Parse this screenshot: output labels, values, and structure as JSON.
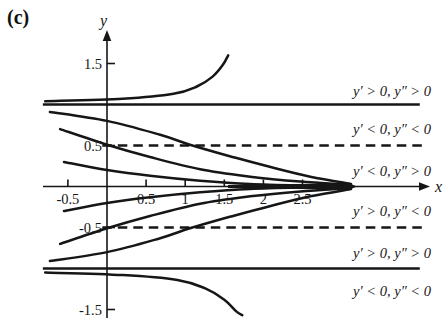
{
  "figure_label": "(c)",
  "colors": {
    "ink": "#161616",
    "background": "#ffffff"
  },
  "chart_data": {
    "type": "line",
    "title": "(c)",
    "xlabel": "x",
    "ylabel": "y",
    "x_ticks": [
      -0.5,
      0.5,
      1,
      1.5,
      2,
      2.5
    ],
    "x_tick_labels": [
      "-0.5",
      "0.5",
      "1",
      "1.5",
      "2",
      "2.5"
    ],
    "y_ticks": [
      1.5,
      0.5,
      -0.5,
      -1.5
    ],
    "y_tick_labels": [
      "1.5",
      "0.5",
      "-0.5",
      "-1.5"
    ],
    "xlim": [
      -0.82,
      4.35
    ],
    "ylim": [
      -1.85,
      1.87
    ],
    "grid": false,
    "equilibrium_lines": {
      "style": "solid",
      "values": [
        1,
        -1
      ],
      "x_range": [
        -0.82,
        4.0
      ]
    },
    "inflection_lines": {
      "style": "dashed",
      "values": [
        0.5,
        -0.5
      ],
      "x_range": [
        -0.06,
        4.03
      ]
    },
    "region_labels": [
      {
        "text": "y′ > 0, y″ > 0",
        "band": "y > 1",
        "y": 1.16
      },
      {
        "text": "y′ < 0, y″ < 0",
        "band": "0.5 < y < 1",
        "y": 0.7
      },
      {
        "text": "y′ < 0, y″ > 0",
        "band": "0 < y < 0.5",
        "y": 0.19
      },
      {
        "text": "y′ > 0, y″ < 0",
        "band": "-0.5 < y < 0",
        "y": -0.3
      },
      {
        "text": "y′ > 0, y″ > 0",
        "band": "-1 < y < -0.5",
        "y": -0.81
      },
      {
        "text": "y′ < 0, y″ < 0",
        "band": "y < -1",
        "y": -1.28
      }
    ],
    "series": [
      {
        "name": "solution-diverging-above-y1",
        "points": [
          [
            -0.79,
            1.04
          ],
          [
            0.2,
            1.07
          ],
          [
            0.85,
            1.13
          ],
          [
            1.15,
            1.22
          ],
          [
            1.35,
            1.34
          ],
          [
            1.48,
            1.48
          ],
          [
            1.55,
            1.6
          ]
        ]
      },
      {
        "name": "solution-decreasing-from-0.91",
        "points": [
          [
            -0.73,
            0.91
          ],
          [
            0,
            0.8
          ],
          [
            0.68,
            0.63
          ],
          [
            1.06,
            0.51
          ],
          [
            1.57,
            0.37
          ],
          [
            2.08,
            0.24
          ],
          [
            2.6,
            0.12
          ],
          [
            3.12,
            0.03
          ]
        ]
      },
      {
        "name": "solution-decreasing-from-0.70",
        "points": [
          [
            -0.6,
            0.7
          ],
          [
            0,
            0.51
          ],
          [
            0.55,
            0.36
          ],
          [
            1.19,
            0.21
          ],
          [
            1.83,
            0.12
          ],
          [
            2.47,
            0.06
          ],
          [
            3.12,
            0.02
          ]
        ]
      },
      {
        "name": "solution-decreasing-from-0.30",
        "points": [
          [
            -0.55,
            0.3
          ],
          [
            0,
            0.2
          ],
          [
            0.55,
            0.13
          ],
          [
            1.19,
            0.07
          ],
          [
            1.83,
            0.03
          ],
          [
            2.6,
            0.01
          ],
          [
            3.12,
            0.003
          ]
        ]
      },
      {
        "name": "solution-increasing-from-minus0.30",
        "points": [
          [
            -0.55,
            -0.3
          ],
          [
            0,
            -0.2
          ],
          [
            0.55,
            -0.13
          ],
          [
            1.19,
            -0.07
          ],
          [
            1.83,
            -0.03
          ],
          [
            2.6,
            -0.01
          ],
          [
            3.12,
            -0.003
          ]
        ]
      },
      {
        "name": "solution-increasing-from-minus0.70",
        "points": [
          [
            -0.6,
            -0.7
          ],
          [
            0,
            -0.51
          ],
          [
            0.55,
            -0.36
          ],
          [
            1.19,
            -0.21
          ],
          [
            1.83,
            -0.12
          ],
          [
            2.47,
            -0.06
          ],
          [
            3.12,
            -0.02
          ]
        ]
      },
      {
        "name": "solution-increasing-from-minus0.91",
        "points": [
          [
            -0.73,
            -0.91
          ],
          [
            0,
            -0.8
          ],
          [
            0.68,
            -0.63
          ],
          [
            1.06,
            -0.51
          ],
          [
            1.57,
            -0.37
          ],
          [
            2.08,
            -0.24
          ],
          [
            2.6,
            -0.12
          ],
          [
            3.12,
            -0.03
          ]
        ]
      },
      {
        "name": "solution-diverging-below-yminus1",
        "points": [
          [
            -0.79,
            -1.05
          ],
          [
            0.2,
            -1.08
          ],
          [
            0.9,
            -1.14
          ],
          [
            1.25,
            -1.24
          ],
          [
            1.5,
            -1.38
          ],
          [
            1.65,
            -1.52
          ],
          [
            1.73,
            -1.57
          ]
        ]
      }
    ]
  }
}
